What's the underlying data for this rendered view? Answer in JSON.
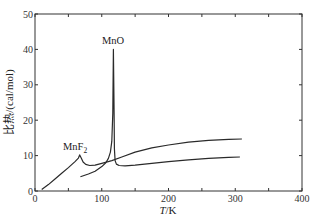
{
  "chart_data": {
    "type": "line",
    "title": "",
    "xlabel": "T/K",
    "ylabel": "比热/(cal/mol)",
    "xlim": [
      0,
      400
    ],
    "ylim": [
      0,
      50
    ],
    "xticks": [
      0,
      100,
      200,
      300,
      400
    ],
    "yticks": [
      0,
      10,
      20,
      30,
      40,
      50
    ],
    "grid": false,
    "legend": "inline labels",
    "series": [
      {
        "name": "MnF2",
        "label": "MnF",
        "label_sub": "2",
        "x": [
          10,
          20,
          30,
          40,
          50,
          60,
          65,
          67,
          69,
          72,
          76,
          82,
          90,
          100,
          115,
          130,
          150,
          175,
          200,
          230,
          260,
          290,
          310
        ],
        "y": [
          0.4,
          1.8,
          3.4,
          5.0,
          6.6,
          8.3,
          9.3,
          10.2,
          9.4,
          8.2,
          7.5,
          7.2,
          7.3,
          7.8,
          8.6,
          9.6,
          11.0,
          12.2,
          13.0,
          13.8,
          14.3,
          14.6,
          14.7
        ]
      },
      {
        "name": "MnO",
        "label": "MnO",
        "x": [
          68,
          80,
          90,
          100,
          106,
          110,
          113,
          115,
          116.5,
          117.5,
          118.5,
          119,
          120,
          122,
          126,
          135,
          150,
          175,
          200,
          230,
          260,
          290,
          307
        ],
        "y": [
          4.0,
          4.8,
          5.6,
          6.9,
          8.0,
          9.2,
          11.0,
          14.0,
          22.0,
          40.0,
          22.0,
          12.0,
          8.6,
          7.6,
          7.2,
          7.1,
          7.3,
          7.8,
          8.3,
          8.8,
          9.2,
          9.5,
          9.6
        ]
      }
    ],
    "annotations": [
      {
        "text": "MnO",
        "x": 117,
        "y": 41.5
      },
      {
        "text": "MnF2",
        "x": 60,
        "y": 11.5
      }
    ]
  },
  "axes": {
    "x_title_italic": "T",
    "x_title_unit": "/K",
    "y_title": "比热/(cal/mol)"
  }
}
